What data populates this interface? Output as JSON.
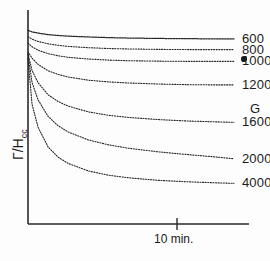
{
  "figure": {
    "axes": {
      "y_label_main": "Γ/H",
      "y_label_sub": "cc",
      "x_tick_label": "10 min.",
      "unit_label": "G"
    }
  },
  "chart_data": {
    "type": "line",
    "title": "",
    "subtitle": "",
    "xlabel": "10 min.",
    "ylabel": "Γ/H_cc",
    "legend_position": "right-inline-end-of-curve",
    "grid": false,
    "axis_style": "two-spine (left and bottom only), arrowless",
    "line_style": "dotted / stippled",
    "xlim": [
      0,
      22
    ],
    "ylim": [
      0,
      1
    ],
    "x_ticks": [
      {
        "value": 10,
        "label": "10 min."
      }
    ],
    "y_ticks": [],
    "series_unit": "G",
    "series": [
      {
        "name": "600",
        "label": "600",
        "unit": "G",
        "start_y": 0.905,
        "plateau_y": 0.865,
        "x": [
          0,
          0.4,
          1,
          2,
          3,
          4,
          6,
          8,
          10,
          13,
          16,
          19,
          20.5
        ],
        "values": [
          0.905,
          0.898,
          0.892,
          0.885,
          0.881,
          0.878,
          0.874,
          0.871,
          0.869,
          0.867,
          0.866,
          0.865,
          0.865
        ]
      },
      {
        "name": "800",
        "label": "800",
        "unit": "G",
        "start_y": 0.875,
        "plateau_y": 0.815,
        "x": [
          0,
          0.4,
          1,
          2,
          3,
          4,
          6,
          8,
          10,
          13,
          16,
          19,
          20.5
        ],
        "values": [
          0.875,
          0.864,
          0.853,
          0.842,
          0.835,
          0.83,
          0.824,
          0.82,
          0.818,
          0.816,
          0.815,
          0.815,
          0.815
        ]
      },
      {
        "name": "1000",
        "label": "1000",
        "unit": "G",
        "ink_blot": true,
        "start_y": 0.845,
        "plateau_y": 0.76,
        "x": [
          0,
          0.4,
          1,
          2,
          3,
          4,
          6,
          8,
          10,
          13,
          16,
          19,
          20.5
        ],
        "values": [
          0.845,
          0.828,
          0.812,
          0.796,
          0.786,
          0.779,
          0.771,
          0.766,
          0.763,
          0.761,
          0.76,
          0.76,
          0.76
        ]
      },
      {
        "name": "1200",
        "label": "1200",
        "unit": "G",
        "start_y": 0.805,
        "plateau_y": 0.65,
        "x": [
          0,
          0.4,
          1,
          2,
          3,
          4,
          6,
          8,
          10,
          13,
          16,
          19,
          20.5
        ],
        "values": [
          0.805,
          0.775,
          0.746,
          0.716,
          0.699,
          0.687,
          0.672,
          0.664,
          0.659,
          0.654,
          0.651,
          0.65,
          0.65
        ]
      },
      {
        "name": "1600",
        "label": "1600",
        "unit": "G",
        "start_y": 0.795,
        "plateau_y": 0.475,
        "x": [
          0,
          0.4,
          1,
          2,
          3,
          4,
          6,
          8,
          10,
          13,
          16,
          19,
          20.5
        ],
        "values": [
          0.795,
          0.718,
          0.66,
          0.604,
          0.572,
          0.551,
          0.524,
          0.508,
          0.498,
          0.488,
          0.481,
          0.477,
          0.475
        ]
      },
      {
        "name": "2000",
        "label": "2000",
        "unit": "G",
        "start_y": 0.79,
        "plateau_y": 0.305,
        "x": [
          0,
          0.4,
          1,
          2,
          3,
          4,
          6,
          8,
          10,
          13,
          16,
          19,
          20.5
        ],
        "values": [
          0.79,
          0.662,
          0.58,
          0.503,
          0.459,
          0.43,
          0.393,
          0.37,
          0.354,
          0.337,
          0.324,
          0.312,
          0.305
        ]
      },
      {
        "name": "4000",
        "label": "4000",
        "unit": "G",
        "start_y": 0.775,
        "plateau_y": 0.19,
        "x": [
          0,
          0.4,
          1,
          2,
          3,
          4,
          6,
          8,
          10,
          13,
          16,
          19,
          20.5
        ],
        "values": [
          0.775,
          0.56,
          0.452,
          0.36,
          0.312,
          0.283,
          0.248,
          0.228,
          0.216,
          0.204,
          0.197,
          0.192,
          0.19
        ]
      }
    ]
  }
}
